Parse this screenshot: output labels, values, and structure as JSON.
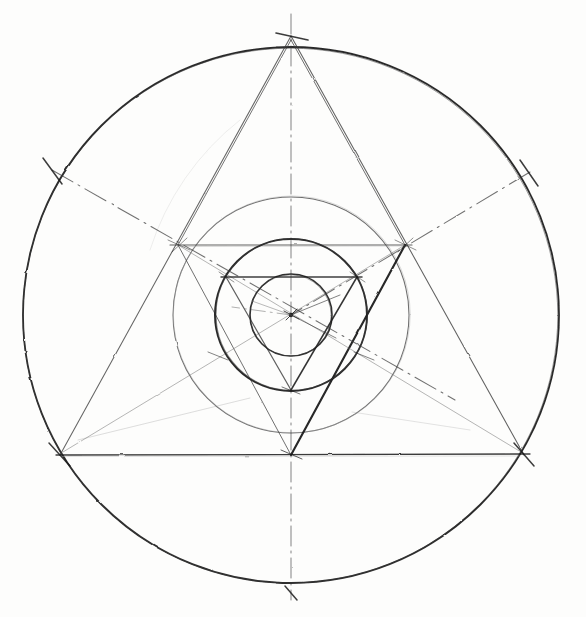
{
  "figure": {
    "title": "Geometric construction: nested circles and triangles",
    "medium": "pencil on paper",
    "background_color": "#fdfdfc",
    "ink_color": "#1a1a1a",
    "faint_ink_color": "#6e6e6e",
    "ghost_ink_color": "#a9a9a9"
  },
  "geometry": {
    "center": {
      "x": 291,
      "y": 315
    },
    "circles": [
      {
        "name": "outer-circumscribed-circle",
        "cx": 291,
        "cy": 315,
        "r": 268,
        "weight": 1.6,
        "tone": "dark"
      },
      {
        "name": "middle-circle",
        "cx": 291,
        "cy": 315,
        "r": 118,
        "weight": 1.0,
        "tone": "soft"
      },
      {
        "name": "inner-circumcircle",
        "cx": 291,
        "cy": 315,
        "r": 76,
        "weight": 1.8,
        "tone": "dark"
      },
      {
        "name": "innermost-circle",
        "cx": 291,
        "cy": 315,
        "r": 41,
        "weight": 1.5,
        "tone": "dark"
      }
    ],
    "outer_triangle": {
      "name": "outer-equilateral-triangle",
      "orientation": "point-up",
      "vertices": [
        {
          "label": "top",
          "x": 291,
          "y": 36
        },
        {
          "label": "bottom-left",
          "x": 60,
          "y": 455
        },
        {
          "label": "bottom-right",
          "x": 524,
          "y": 455
        }
      ]
    },
    "mid_triangle": {
      "name": "middle-equilateral-triangle",
      "orientation": "point-down",
      "vertices": [
        {
          "label": "upper-left",
          "x": 178,
          "y": 245
        },
        {
          "label": "upper-right",
          "x": 405,
          "y": 245
        },
        {
          "label": "bottom",
          "x": 291,
          "y": 455
        }
      ]
    },
    "inner_triangle": {
      "name": "inner-equilateral-triangle",
      "orientation": "point-down",
      "vertices": [
        {
          "label": "upper-left",
          "x": 226,
          "y": 277
        },
        {
          "label": "upper-right",
          "x": 357,
          "y": 277
        },
        {
          "label": "bottom",
          "x": 291,
          "y": 390
        }
      ]
    },
    "hexagon_points": [
      {
        "label": "N",
        "x": 291,
        "y": 47
      },
      {
        "label": "NE",
        "x": 523,
        "y": 181
      },
      {
        "label": "SE",
        "x": 523,
        "y": 449
      },
      {
        "label": "S",
        "x": 291,
        "y": 583
      },
      {
        "label": "SW",
        "x": 59,
        "y": 449
      },
      {
        "label": "NW",
        "x": 59,
        "y": 181
      }
    ],
    "radial_centre_lines": [
      {
        "name": "vertical-centre-line",
        "style": "dash-dot",
        "from": {
          "x": 291,
          "y": 14
        },
        "to": {
          "x": 291,
          "y": 600
        }
      },
      {
        "name": "nw-se-centre-line",
        "style": "dash-dot",
        "from": {
          "x": 52,
          "y": 170
        },
        "to": {
          "x": 455,
          "y": 400
        }
      },
      {
        "name": "ne-sw-centre-line",
        "style": "dash-dot",
        "from": {
          "x": 530,
          "y": 172
        },
        "to": {
          "x": 178,
          "y": 245
        }
      }
    ],
    "tick_marks": [
      {
        "name": "tick-top",
        "x": 291,
        "y": 36,
        "angle": 90
      },
      {
        "name": "tick-upper-left",
        "x": 52,
        "y": 170,
        "angle": 30
      },
      {
        "name": "tick-upper-right",
        "x": 528,
        "y": 172,
        "angle": -30
      },
      {
        "name": "tick-lower-left",
        "x": 60,
        "y": 455,
        "angle": -30
      },
      {
        "name": "tick-lower-right",
        "x": 524,
        "y": 455,
        "angle": 30
      },
      {
        "name": "tick-bottom",
        "x": 291,
        "y": 594,
        "angle": 90
      }
    ]
  }
}
